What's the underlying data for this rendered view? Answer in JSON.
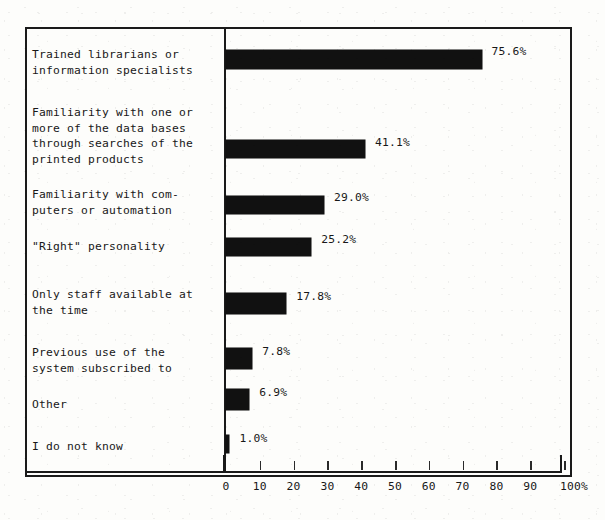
{
  "chart_data": {
    "type": "bar",
    "orientation": "horizontal",
    "title": "",
    "subtitle": "",
    "xlabel": "",
    "ylabel": "",
    "xlim": [
      0,
      100
    ],
    "grid": false,
    "legend": null,
    "axis_unit": "%",
    "tick_labels": [
      "0",
      "10",
      "20",
      "30",
      "40",
      "50",
      "60",
      "70",
      "80",
      "90",
      "100%"
    ],
    "tick_values": [
      0,
      10,
      20,
      30,
      40,
      50,
      60,
      70,
      80,
      90,
      100
    ],
    "categories": [
      "Trained librarians or\ninformation specialists",
      "Familiarity with one or\nmore of the data bases\nthrough searches of the\nprinted products",
      "Familiarity with com-\nputers or automation",
      "\"Right\" personality",
      "Only staff available at\nthe time",
      "Previous use of the\nsystem subscribed to",
      "Other",
      "I do not know"
    ],
    "values": [
      75.6,
      41.1,
      29.0,
      25.2,
      17.8,
      7.8,
      6.9,
      1.0
    ],
    "value_labels": [
      "75.6%",
      "41.1%",
      "29.0%",
      "25.2%",
      "17.8%",
      "7.8%",
      "6.9%",
      "1.0%"
    ],
    "bar_color": "#111111",
    "frame_color": "#1a1a1a",
    "background_color": "#fdfdfb"
  },
  "layout": {
    "bars": [
      {
        "top": 23,
        "height": 19,
        "label_top": 18,
        "cat_top": 20
      },
      {
        "top": 113,
        "height": 18,
        "label_top": 109,
        "cat_top": 78
      },
      {
        "top": 169,
        "height": 18,
        "label_top": 164,
        "cat_top": 160
      },
      {
        "top": 211,
        "height": 18,
        "label_top": 206,
        "cat_top": 212
      },
      {
        "top": 266,
        "height": 21,
        "label_top": 263,
        "cat_top": 260
      },
      {
        "top": 321,
        "height": 21,
        "label_top": 318,
        "cat_top": 318
      },
      {
        "top": 362,
        "height": 21,
        "label_top": 359,
        "cat_top": 370
      },
      {
        "top": 408,
        "height": 18,
        "label_top": 405,
        "cat_top": 412
      }
    ],
    "px_per_unit": 3.38,
    "axis_left": 226
  }
}
